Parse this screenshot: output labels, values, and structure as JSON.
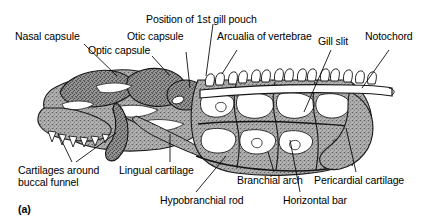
{
  "figure": {
    "panel_id": "(a)",
    "ink_color": "#000000",
    "cartilage_fill": "#9a9a9a",
    "background": "#ffffff"
  },
  "labels": [
    {
      "id": "nasal-capsule",
      "text": "Nasal capsule"
    },
    {
      "id": "optic-capsule",
      "text": "Optic capsule"
    },
    {
      "id": "otic-capsule",
      "text": "Otic capsule"
    },
    {
      "id": "position-1st-gill-pouch",
      "text": "Position of 1st gill pouch"
    },
    {
      "id": "arcualia-of-vertebrae",
      "text": "Arcualia of vertebrae"
    },
    {
      "id": "gill-slit",
      "text": "Gill slit"
    },
    {
      "id": "notochord",
      "text": "Notochord"
    },
    {
      "id": "cartilages-around-buccal-funnel-line1",
      "text": "Cartilages around"
    },
    {
      "id": "cartilages-around-buccal-funnel-line2",
      "text": "buccal funnel"
    },
    {
      "id": "lingual-cartilage",
      "text": "Lingual cartilage"
    },
    {
      "id": "hypobranchial-rod",
      "text": "Hypobranchial rod"
    },
    {
      "id": "branchial-arch",
      "text": "Branchial arch"
    },
    {
      "id": "horizontal-bar",
      "text": "Horizontal bar"
    },
    {
      "id": "pericardial-cartilage",
      "text": "Pericardial cartilage"
    }
  ]
}
